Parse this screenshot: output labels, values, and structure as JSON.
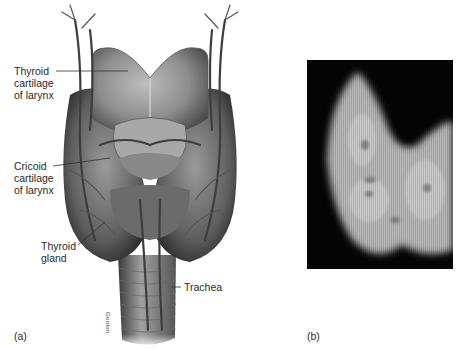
{
  "figure": {
    "panels": [
      {
        "id": "a",
        "letter": "(a)",
        "type": "anatomical-illustration",
        "signature": "Gordon",
        "labels": [
          {
            "key": "thyroid_cartilage",
            "text": "Thyroid\ncartilage\nof larynx"
          },
          {
            "key": "cricoid_cartilage",
            "text": "Cricoid\ncartilage\nof larynx"
          },
          {
            "key": "thyroid_gland",
            "text": "Thyroid\ngland"
          },
          {
            "key": "trachea",
            "text": "Trachea"
          }
        ]
      },
      {
        "id": "b",
        "letter": "(b)",
        "type": "thyroid-scan-image",
        "background_color": "#050505"
      }
    ]
  },
  "colors": {
    "background": "#ffffff",
    "label_text": "#2a2a2a",
    "scan_background": "#050505",
    "scan_tissue": "#c8c8c8"
  }
}
